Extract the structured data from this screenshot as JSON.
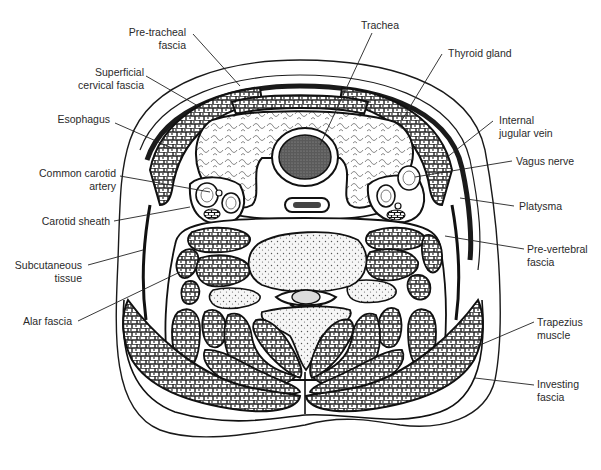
{
  "figure": {
    "colors": {
      "ink": "#1a1a1a",
      "label_text": "#2a2a2a",
      "background": "#ffffff",
      "stipple": "#555555"
    }
  },
  "labels": {
    "left": [
      {
        "id": "pre-tracheal-fascia",
        "text": "Pre-tracheal\nfascia"
      },
      {
        "id": "superficial-cervical-fascia",
        "text": "Superficial\ncervical fascia"
      },
      {
        "id": "esophagus",
        "text": "Esophagus"
      },
      {
        "id": "common-carotid-artery",
        "text": "Common carotid\nartery"
      },
      {
        "id": "carotid-sheath",
        "text": "Carotid sheath"
      },
      {
        "id": "subcutaneous-tissue",
        "text": "Subcutaneous\ntissue"
      },
      {
        "id": "alar-fascia",
        "text": "Alar fascia"
      }
    ],
    "top": [
      {
        "id": "trachea",
        "text": "Trachea"
      },
      {
        "id": "thyroid-gland",
        "text": "Thyroid gland"
      }
    ],
    "right": [
      {
        "id": "internal-jugular-vein",
        "text": "Internal\njugular vein"
      },
      {
        "id": "vagus-nerve",
        "text": "Vagus nerve"
      },
      {
        "id": "platysma",
        "text": "Platysma"
      },
      {
        "id": "pre-vertebral-fascia",
        "text": "Pre-vertebral\nfascia"
      },
      {
        "id": "trapezius-muscle",
        "text": "Trapezius\nmuscle"
      },
      {
        "id": "investing-fascia",
        "text": "Investing\nfascia"
      }
    ]
  }
}
